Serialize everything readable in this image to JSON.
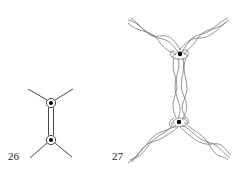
{
  "figures": [
    {
      "id": "fig-26",
      "label": "26",
      "description": "Two trivalent vertices joined by a double edge (ribbon), each vertex marked with a dot in a circle",
      "nodes": [
        {
          "name": "top-vertex",
          "cx": 51,
          "cy": 103
        },
        {
          "name": "bottom-vertex",
          "cx": 51,
          "cy": 140
        }
      ],
      "arms": [
        {
          "x1": 28,
          "y1": 89,
          "x2": 47,
          "y2": 100
        },
        {
          "x1": 73,
          "y1": 89,
          "x2": 55,
          "y2": 100
        },
        {
          "x1": 47,
          "y1": 143,
          "x2": 30,
          "y2": 158
        },
        {
          "x1": 55,
          "y1": 143,
          "x2": 72,
          "y2": 157
        }
      ]
    },
    {
      "id": "fig-27",
      "label": "27",
      "description": "Braided/twisted strands version of the same graph: four braided arms meeting at two marked vertices connected by a braided vertical bundle",
      "nodes": [
        {
          "name": "top-vertex",
          "cx": 180,
          "cy": 54
        },
        {
          "name": "bottom-vertex",
          "cx": 179,
          "cy": 122
        }
      ],
      "arm_endpoints": {
        "top_left": [
          128,
          20
        ],
        "top_right": [
          228,
          18
        ],
        "bottom_left": [
          128,
          163
        ],
        "bottom_right": [
          230,
          158
        ]
      }
    }
  ],
  "colors": {
    "stroke": "#333333",
    "braid_stroke": "#666666",
    "dot": "#000000",
    "background": "#ffffff"
  }
}
